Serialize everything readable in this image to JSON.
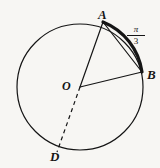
{
  "figure": {
    "type": "circle-geometry-diagram",
    "background_color": "#f7f6f3",
    "stroke_color": "#151515",
    "circle": {
      "center_label": "O",
      "center_x": 80,
      "center_y": 87,
      "radius": 63
    },
    "points": [
      {
        "label": "A",
        "x": 103,
        "y": 22,
        "label_x": 98,
        "label_y": 8
      },
      {
        "label": "B",
        "x": 142,
        "y": 72,
        "label_x": 147,
        "label_y": 68
      },
      {
        "label": "O",
        "x": 80,
        "y": 87,
        "label_x": 62,
        "label_y": 80
      },
      {
        "label": "D",
        "x": 57,
        "y": 152,
        "label_x": 50,
        "label_y": 150
      }
    ],
    "segments": [
      {
        "name": "radius-OA",
        "from": "O",
        "to": "A",
        "style": "solid"
      },
      {
        "name": "radius-OB",
        "from": "O",
        "to": "B",
        "style": "solid"
      },
      {
        "name": "chord-AB",
        "from": "A",
        "to": "B",
        "style": "solid"
      },
      {
        "name": "radius-OD",
        "from": "O",
        "to": "D",
        "style": "dashed"
      }
    ],
    "highlighted_arc": {
      "name": "arc-AB",
      "from": "A",
      "to": "B",
      "style": "bold",
      "measure_numerator": "π",
      "measure_denominator": "3"
    }
  }
}
